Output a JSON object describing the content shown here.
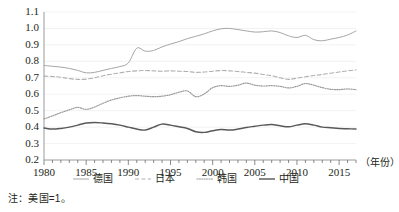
{
  "note": "注：美国=1。",
  "axis": {
    "x_title": "（年份）",
    "y_ticks": [
      "1.1",
      "1.0",
      "0.9",
      "0.8",
      "0.7",
      "0.6",
      "0.5",
      "0.4",
      "0.3",
      "0.2"
    ],
    "x_ticks": [
      "1980",
      "1985",
      "1990",
      "1995",
      "2000",
      "2005",
      "2010",
      "2015"
    ]
  },
  "legend": {
    "items": [
      {
        "label": "德国",
        "style": "solid-light",
        "color": "#a6a6a6"
      },
      {
        "label": "日本",
        "style": "dashed",
        "color": "#b0b0b0"
      },
      {
        "label": "韩国",
        "style": "dotted",
        "color": "#9a9a9a"
      },
      {
        "label": "中国",
        "style": "solid-dark",
        "color": "#595959"
      }
    ]
  },
  "chart_data": {
    "type": "line",
    "title": "",
    "subtitle": "",
    "xlabel": "（年份）",
    "ylabel": "",
    "annotation": "注：美国=1。",
    "grid": true,
    "legend_position": "bottom",
    "xlim": [
      1980,
      2017
    ],
    "ylim": [
      0.2,
      1.1
    ],
    "ytick_step": 0.1,
    "xtick_major_step": 5,
    "xtick_minor_step": 1,
    "x": [
      1980,
      1981,
      1982,
      1983,
      1984,
      1985,
      1986,
      1987,
      1988,
      1989,
      1990,
      1991,
      1992,
      1993,
      1994,
      1995,
      1996,
      1997,
      1998,
      1999,
      2000,
      2001,
      2002,
      2003,
      2004,
      2005,
      2006,
      2007,
      2008,
      2009,
      2010,
      2011,
      2012,
      2013,
      2014,
      2015,
      2016,
      2017
    ],
    "series": [
      {
        "name": "德国",
        "style": "solid-light",
        "color": "#a6a6a6",
        "values": [
          0.775,
          0.77,
          0.765,
          0.757,
          0.745,
          0.73,
          0.733,
          0.745,
          0.757,
          0.768,
          0.79,
          0.88,
          0.862,
          0.866,
          0.888,
          0.905,
          0.92,
          0.938,
          0.952,
          0.967,
          0.985,
          0.998,
          1.0,
          0.993,
          0.985,
          0.978,
          0.98,
          0.985,
          0.975,
          0.955,
          0.945,
          0.958,
          0.932,
          0.925,
          0.935,
          0.945,
          0.96,
          0.985
        ]
      },
      {
        "name": "日本",
        "style": "dashed",
        "color": "#b0b0b0",
        "values": [
          0.71,
          0.708,
          0.703,
          0.695,
          0.69,
          0.692,
          0.7,
          0.712,
          0.722,
          0.73,
          0.738,
          0.742,
          0.744,
          0.742,
          0.74,
          0.742,
          0.74,
          0.738,
          0.733,
          0.735,
          0.74,
          0.744,
          0.742,
          0.738,
          0.733,
          0.728,
          0.72,
          0.712,
          0.7,
          0.69,
          0.698,
          0.706,
          0.714,
          0.72,
          0.728,
          0.735,
          0.742,
          0.748
        ]
      },
      {
        "name": "韩国",
        "style": "dotted",
        "color": "#9a9a9a",
        "values": [
          0.45,
          0.468,
          0.488,
          0.505,
          0.52,
          0.508,
          0.522,
          0.545,
          0.565,
          0.578,
          0.588,
          0.592,
          0.588,
          0.585,
          0.588,
          0.597,
          0.612,
          0.62,
          0.585,
          0.602,
          0.64,
          0.652,
          0.648,
          0.655,
          0.668,
          0.655,
          0.65,
          0.652,
          0.648,
          0.638,
          0.648,
          0.665,
          0.655,
          0.64,
          0.63,
          0.628,
          0.632,
          0.628
        ]
      },
      {
        "name": "中国",
        "style": "solid-dark",
        "color": "#595959",
        "values": [
          0.395,
          0.388,
          0.392,
          0.4,
          0.412,
          0.425,
          0.428,
          0.425,
          0.42,
          0.412,
          0.4,
          0.388,
          0.382,
          0.4,
          0.418,
          0.412,
          0.402,
          0.392,
          0.372,
          0.368,
          0.378,
          0.385,
          0.382,
          0.388,
          0.398,
          0.405,
          0.412,
          0.416,
          0.408,
          0.402,
          0.412,
          0.42,
          0.412,
          0.4,
          0.396,
          0.392,
          0.39,
          0.388
        ]
      }
    ]
  }
}
